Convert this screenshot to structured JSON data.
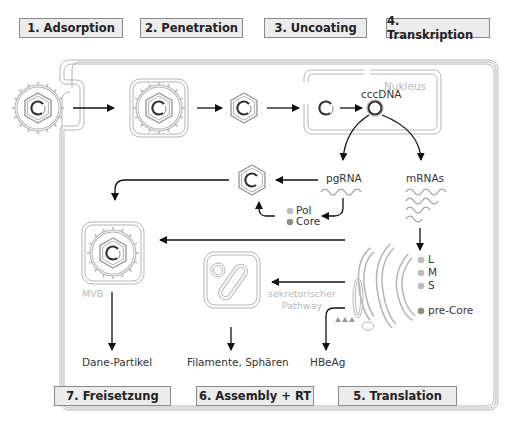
{
  "steps": {
    "s1": "1. Adsorption",
    "s2": "2. Penetration",
    "s3": "3. Uncoating",
    "s4": "4. Transkription",
    "s5": "5. Translation",
    "s6": "6. Assembly + RT",
    "s7": "7. Freisetzung"
  },
  "labels": {
    "nucleus": "Nukleus",
    "cccdna": "cccDNA",
    "pgrna": "pgRNA",
    "mrnas": "mRNAs",
    "pol": "Pol",
    "core": "Core",
    "mvb": "MVB",
    "secretory_1": "sekretorischer",
    "secretory_2": "Pathway",
    "l": "L",
    "m": "M",
    "s": "S",
    "precore": "pre-Core",
    "dane": "Dane-Partikel",
    "filaments": "Filamente, Sphären",
    "hbeag": "HBeAg"
  },
  "colors": {
    "step_bg": "#ececec",
    "step_border": "#8a8a8a",
    "outline_grey": "#b5b5b5",
    "dot_light": "#bdbdbd",
    "dot_dark": "#8f8f8f",
    "arrow": "#111111"
  }
}
